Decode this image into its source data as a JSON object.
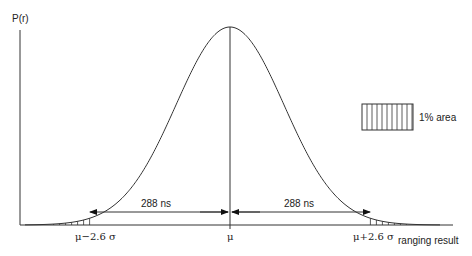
{
  "diagram": {
    "y_axis_label": "P(r)",
    "x_axis_label": "ranging result",
    "ticks": {
      "left": "μ−2.6 σ",
      "center": "μ",
      "right": "μ+2.6 σ"
    },
    "arrows": {
      "left_label": "288 ns",
      "right_label": "288 ns"
    },
    "legend": {
      "label": "1% area",
      "pattern": "vertical-hatch"
    },
    "curve": {
      "type": "gaussian",
      "shaded_tails_sigma": 2.6
    },
    "colors": {
      "line": "#333333",
      "background": "#ffffff"
    }
  },
  "chart_data": {
    "type": "line",
    "title": "",
    "xlabel": "ranging result",
    "ylabel": "P(r)",
    "x_ticks": [
      "μ−2.6 σ",
      "μ",
      "μ+2.6 σ"
    ],
    "annotations": [
      "288 ns",
      "288 ns",
      "1% area"
    ],
    "series": [
      {
        "name": "Gaussian distribution",
        "mean": "μ",
        "shaded_tails": "|x-μ| > 2.6σ (1% area)"
      }
    ]
  }
}
